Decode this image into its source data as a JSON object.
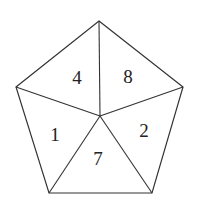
{
  "diagram": {
    "type": "pentagon-divided-into-triangles",
    "stroke_color": "#333333",
    "text_color": "#222222",
    "background": "#ffffff",
    "vertices": {
      "top": [
        99,
        21
      ],
      "right": [
        183,
        87
      ],
      "bottom_right": [
        152,
        193
      ],
      "bottom_left": [
        49,
        193
      ],
      "left": [
        16,
        87
      ],
      "center": [
        100,
        116
      ]
    },
    "regions": [
      {
        "id": "top-left",
        "label": "4",
        "x": 77,
        "y": 84
      },
      {
        "id": "top-right",
        "label": "8",
        "x": 128,
        "y": 83
      },
      {
        "id": "right",
        "label": "2",
        "x": 144,
        "y": 137
      },
      {
        "id": "bottom",
        "label": "7",
        "x": 98,
        "y": 165
      },
      {
        "id": "left",
        "label": "1",
        "x": 55,
        "y": 141
      }
    ]
  }
}
